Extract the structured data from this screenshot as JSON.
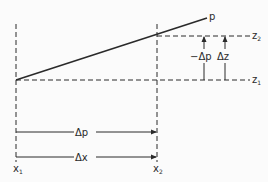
{
  "diagram": {
    "colors": {
      "background": "#fbfbfb",
      "ink": "#2a2a2a"
    },
    "curve": {
      "label": "p",
      "from": [
        16,
        80
      ],
      "to": [
        207,
        18
      ]
    },
    "verticals": [
      {
        "label": "x",
        "sub": "1",
        "x": 16
      },
      {
        "label": "x",
        "sub": "2",
        "x": 157
      }
    ],
    "levels": [
      {
        "label": "z",
        "sub": "2",
        "y": 36
      },
      {
        "label": "z",
        "sub": "1",
        "y": 80
      }
    ],
    "vertical_arrows": [
      {
        "label": "−Δp",
        "x": 204
      },
      {
        "label": "Δz",
        "x": 225
      }
    ],
    "horizontal_arrows": [
      {
        "label": "Δp",
        "y": 132
      },
      {
        "label": "Δx",
        "y": 157
      }
    ]
  }
}
